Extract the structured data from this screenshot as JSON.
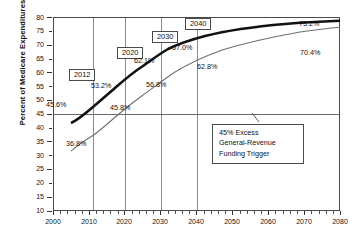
{
  "chart_data": {
    "type": "line",
    "title": "",
    "xlabel": "",
    "ylabel": "Percent of Medicare Expenditures",
    "xlim": [
      2000,
      2080
    ],
    "ylim": [
      10,
      80
    ],
    "xticks": [
      "2000",
      "2010",
      "2020",
      "2030",
      "2040",
      "2050",
      "2060",
      "2070",
      "2080"
    ],
    "yticks": [
      "10",
      "15",
      "20",
      "25",
      "30",
      "35",
      "40",
      "45",
      "50",
      "55",
      "60",
      "65",
      "70",
      "75",
      "80"
    ],
    "grid": "vertical gridlines at 2012, 2020, 2030, 2040; horizontal reference line at 45",
    "legend_position": "none",
    "reference_line": {
      "value": 45,
      "label": "45% Excess General-Revenue Funding Trigger"
    },
    "series": [
      {
        "name": "upper-thick-curve",
        "x": [
          2005,
          2007,
          2009,
          2011,
          2012,
          2014,
          2016,
          2018,
          2020,
          2022,
          2024,
          2026,
          2028,
          2030,
          2032,
          2034,
          2036,
          2038,
          2040,
          2045,
          2050,
          2055,
          2060,
          2065,
          2070,
          2075,
          2080
        ],
        "values": [
          41.5,
          42.6,
          43.8,
          45.0,
          45.6,
          47.8,
          49.9,
          51.7,
          53.2,
          55.2,
          57.0,
          58.7,
          60.5,
          62.1,
          63.4,
          64.6,
          65.6,
          66.4,
          67.0,
          68.4,
          69.5,
          70.4,
          71.2,
          71.9,
          72.4,
          72.8,
          73.2
        ],
        "endpoint_label": "73.2%"
      },
      {
        "name": "lower-thin-curve",
        "x": [
          2005,
          2007,
          2009,
          2011,
          2013,
          2015,
          2017,
          2019,
          2020,
          2022,
          2024,
          2026,
          2028,
          2030,
          2032,
          2034,
          2036,
          2038,
          2040,
          2045,
          2050,
          2055,
          2060,
          2065,
          2070,
          2075,
          2080
        ],
        "values": [
          31.5,
          33.5,
          35.4,
          36.8,
          39.0,
          41.5,
          43.8,
          45.5,
          45.8,
          48.2,
          50.6,
          52.8,
          54.9,
          56.8,
          58.3,
          59.6,
          60.8,
          61.9,
          62.8,
          64.8,
          66.4,
          67.6,
          68.5,
          69.2,
          69.7,
          70.1,
          70.4
        ],
        "endpoint_label": "70.4%"
      }
    ],
    "annotations": [
      {
        "name": "year-box-2012",
        "text": "2012"
      },
      {
        "name": "year-box-2020",
        "text": "2020"
      },
      {
        "name": "year-box-2030",
        "text": "2030"
      },
      {
        "name": "year-box-2040",
        "text": "2040"
      },
      {
        "name": "value-upper-2012",
        "text": "45.6%"
      },
      {
        "name": "value-upper-2020",
        "text": "53.2%"
      },
      {
        "name": "value-upper-2030",
        "text": "62.1%"
      },
      {
        "name": "value-upper-2040",
        "text": "67.0%"
      },
      {
        "name": "value-upper-2080",
        "text": "73.2%"
      },
      {
        "name": "value-lower-2012",
        "text": "36.8%"
      },
      {
        "name": "value-lower-2020",
        "text": "45.8%"
      },
      {
        "name": "value-lower-2030",
        "text": "56.8%"
      },
      {
        "name": "value-lower-2040",
        "text": "62.8%"
      },
      {
        "name": "value-lower-2080",
        "text": "70.4%"
      }
    ],
    "trigger_note": {
      "line1": "45% Excess",
      "line2": "General-Revenue",
      "line3": "Funding Trigger"
    },
    "colors": {
      "upper_series": "#111111",
      "lower_series": "#6e6e6e",
      "axis": "#4a4a4a",
      "gridline": "#8d8d8d",
      "background": "#ffffff"
    }
  }
}
